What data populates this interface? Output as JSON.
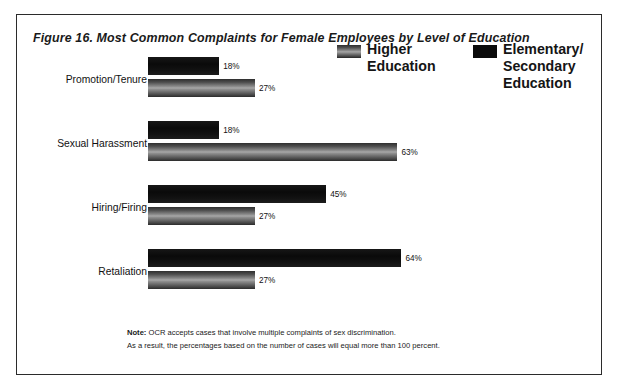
{
  "figure": {
    "title": "Figure 16. Most Common Complaints for Female Employees by Level of Education",
    "note_label": "Note:",
    "note_line_1": "OCR accepts cases that involve multiple complaints of sex discrimination.",
    "note_line_2": "As a result, the percentages based on the number of cases will equal more than 100 percent."
  },
  "legend": {
    "higher_label": "Higher\nEducation",
    "higher_line_1": "Higher",
    "higher_line_2": "Education",
    "higher_swatch": "gray-gradient-swatch",
    "elementary_line_1": "Elementary/",
    "elementary_line_2": "Secondary",
    "elementary_line_3": "Education",
    "elementary_swatch": "solid-black-swatch"
  },
  "colors": {
    "higher_education": "#8d8d8d",
    "elementary_secondary": "#0d0d0d",
    "frame_border": "#2b2b2b",
    "text": "#1a1a1a",
    "background": "#ffffff"
  },
  "chart_data": {
    "type": "bar",
    "orientation": "horizontal",
    "title": "Figure 16. Most Common Complaints for Female Employees by Level of Education",
    "xlabel": "",
    "ylabel": "",
    "xlim": [
      0,
      100
    ],
    "x_unit": "percent",
    "grid": false,
    "legend_position": "top-right",
    "categories": [
      "Promotion/Tenure",
      "Sexual Harassment",
      "Hiring/Firing",
      "Retaliation"
    ],
    "series": [
      {
        "name": "Elementary/Secondary Education",
        "color": "#0d0d0d",
        "values": [
          18,
          18,
          45,
          64
        ],
        "labels": [
          "18%",
          "18%",
          "45%",
          "64%"
        ]
      },
      {
        "name": "Higher Education",
        "color": "#8d8d8d",
        "values": [
          27,
          63,
          27,
          27
        ],
        "labels": [
          "27%",
          "63%",
          "27%",
          "27%"
        ]
      }
    ],
    "annotations": [
      "Note: OCR accepts cases that involve multiple complaints of sex discrimination.",
      "As a result, the percentages based on the number of cases will equal more than 100 percent."
    ]
  }
}
